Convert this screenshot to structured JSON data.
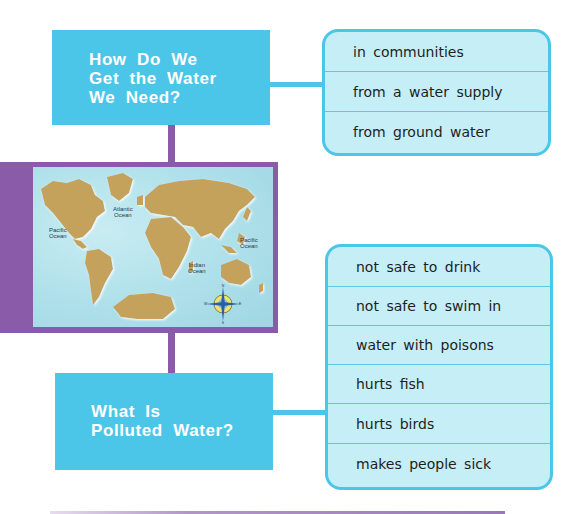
{
  "diagram": {
    "top_question": {
      "lines": [
        "How Do We",
        "Get the Water",
        "We Need?"
      ]
    },
    "top_answers": [
      "in communities",
      "from a water supply",
      "from ground water"
    ],
    "map": {
      "labels": {
        "pacific_left": [
          "Pacific",
          "Ocean"
        ],
        "atlantic": [
          "Atlantic",
          "Ocean"
        ],
        "indian": [
          "Indian",
          "Ocean"
        ],
        "pacific_right": [
          "Pacific",
          "Ocean"
        ]
      },
      "compass": {
        "n": "N",
        "s": "S",
        "e": "E",
        "w": "W"
      }
    },
    "bottom_question": {
      "lines": [
        "What Is",
        "Polluted Water?"
      ]
    },
    "bottom_answers": [
      "not safe to drink",
      "not safe to swim in",
      "water with poisons",
      "hurts fish",
      "hurts birds",
      "makes people sick"
    ]
  },
  "colors": {
    "question_box": "#4cc6e8",
    "answer_box_fill": "#c6eef6",
    "connector_purple": "#8a5ba8",
    "land": "#c4a25c",
    "ocean": "#aee0ea"
  }
}
